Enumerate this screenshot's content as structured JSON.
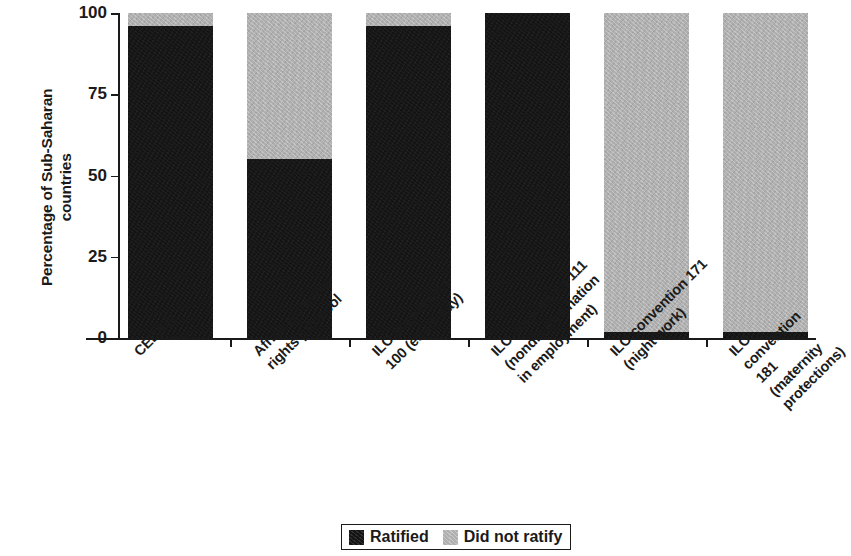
{
  "chart_data": {
    "type": "bar",
    "stacked": true,
    "title": "",
    "xlabel": "",
    "ylabel": "Percentage of Sub-Saharan countries",
    "ylim": [
      0,
      100
    ],
    "yticks": [
      0,
      25,
      50,
      75,
      100
    ],
    "ytick_labels": [
      "0",
      "25",
      "50",
      "75",
      "100"
    ],
    "grid": false,
    "legend_position": "bottom-center",
    "categories": [
      "CEDAW",
      "Africa women's rights protocol",
      "ILO convention 100 (equal pay)",
      "ILO convention 111 (nondiscrimination in employment)",
      "ILO convention 171 (night work)",
      "ILO convention 181 (maternity protections)"
    ],
    "category_lines": [
      [
        "CEDAW"
      ],
      [
        "Africa women's",
        "rights protocol"
      ],
      [
        "ILO convention",
        "100 (equal pay)"
      ],
      [
        "ILO convention 111",
        "(nondiscrimination",
        "in employment)"
      ],
      [
        "ILO convention 171",
        "(night work)"
      ],
      [
        "ILO convention 181",
        "(maternity protections)"
      ]
    ],
    "series": [
      {
        "name": "Ratified",
        "color": "#141414",
        "values": [
          96,
          55,
          96,
          100,
          2,
          2
        ]
      },
      {
        "name": "Did not ratify",
        "color": "#b0b0b0",
        "values": [
          4,
          45,
          4,
          0,
          98,
          98
        ]
      }
    ]
  },
  "axis": {
    "y_title_text": "Percentage of Sub-Saharan\ncounties"
  },
  "legend": {
    "items": [
      {
        "label": "Ratified",
        "swatch": "black-swatch"
      },
      {
        "label": "Did not ratify",
        "swatch": "gray-swatch"
      }
    ]
  }
}
